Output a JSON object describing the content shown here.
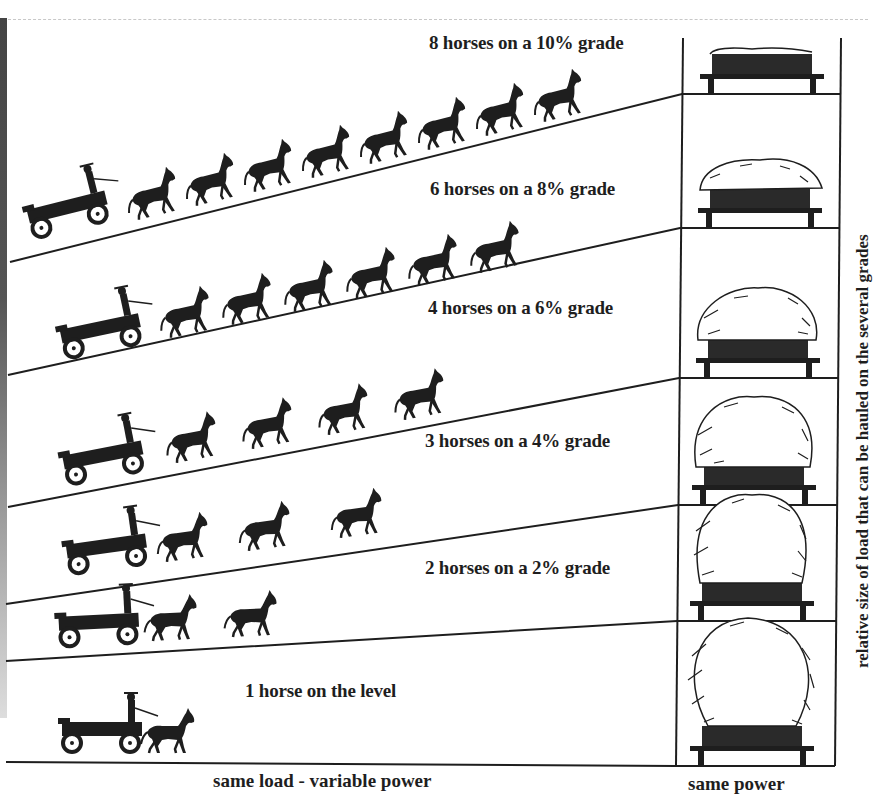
{
  "figure": {
    "grades": [
      {
        "horses": 8,
        "grade_percent": 10,
        "label": "8 horses on a 10% grade"
      },
      {
        "horses": 6,
        "grade_percent": 8,
        "label": "6 horses on a 8% grade"
      },
      {
        "horses": 4,
        "grade_percent": 6,
        "label": "4 horses on a 6% grade"
      },
      {
        "horses": 3,
        "grade_percent": 4,
        "label": "3 horses on a 4% grade"
      },
      {
        "horses": 2,
        "grade_percent": 2,
        "label": "2 horses on a 2% grade"
      },
      {
        "horses": 1,
        "grade_percent": 0,
        "label": "1 horse on the level"
      }
    ],
    "left_caption": "same load - variable power",
    "right_caption": "same power",
    "vertical_axis_label": "relative size of load that can be hauled on the several grades",
    "colors": {
      "ink": "#1e1e1e",
      "paper": "#ffffff",
      "bleed_through": "#d8d8d8"
    }
  }
}
